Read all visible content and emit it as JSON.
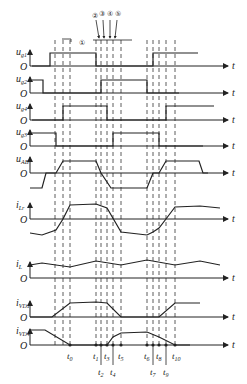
{
  "diagram": {
    "type": "timing-waveforms",
    "axis_var": "t",
    "origin_label": "O",
    "signals": [
      {
        "id": "ug1",
        "label": "u",
        "sub": "g1",
        "baseline": 66
      },
      {
        "id": "ug2",
        "label": "u",
        "sub": "g2",
        "baseline": 93
      },
      {
        "id": "ug4",
        "label": "u",
        "sub": "g4",
        "baseline": 120
      },
      {
        "id": "ug3",
        "label": "u",
        "sub": "g3",
        "baseline": 146
      },
      {
        "id": "uAB",
        "label": "u",
        "sub": "AB",
        "baseline": 173
      },
      {
        "id": "iLr",
        "label": "i",
        "sub": "Lr",
        "baseline": 219
      },
      {
        "id": "iL",
        "label": "i",
        "sub": "L",
        "baseline": 278
      },
      {
        "id": "iVD1",
        "label": "i",
        "sub": "VD1",
        "baseline": 317
      },
      {
        "id": "iVD4",
        "label": "i",
        "sub": "VD4",
        "baseline": 345
      }
    ],
    "time_marks": [
      {
        "label": "t",
        "sub": "0",
        "x": 70,
        "row": "upper"
      },
      {
        "label": "t",
        "sub": "1",
        "x": 96,
        "row": "upper"
      },
      {
        "label": "t",
        "sub": "2",
        "x": 101,
        "row": "lower"
      },
      {
        "label": "t",
        "sub": "3",
        "x": 107,
        "row": "upper"
      },
      {
        "label": "t",
        "sub": "4",
        "x": 113,
        "row": "lower"
      },
      {
        "label": "t",
        "sub": "5",
        "x": 121,
        "row": "upper"
      },
      {
        "label": "t",
        "sub": "6",
        "x": 147,
        "row": "upper"
      },
      {
        "label": "t",
        "sub": "7",
        "x": 153,
        "row": "lower"
      },
      {
        "label": "t",
        "sub": "8",
        "x": 159,
        "row": "upper"
      },
      {
        "label": "t",
        "sub": "9",
        "x": 166,
        "row": "lower"
      },
      {
        "label": "t",
        "sub": "10",
        "x": 175,
        "row": "upper"
      }
    ],
    "annotations": [
      "①",
      "②",
      "③",
      "④",
      "⑤"
    ],
    "dashed_x": [
      55,
      63,
      70,
      96,
      101,
      107,
      113,
      121,
      147,
      153,
      159,
      166,
      175
    ]
  }
}
